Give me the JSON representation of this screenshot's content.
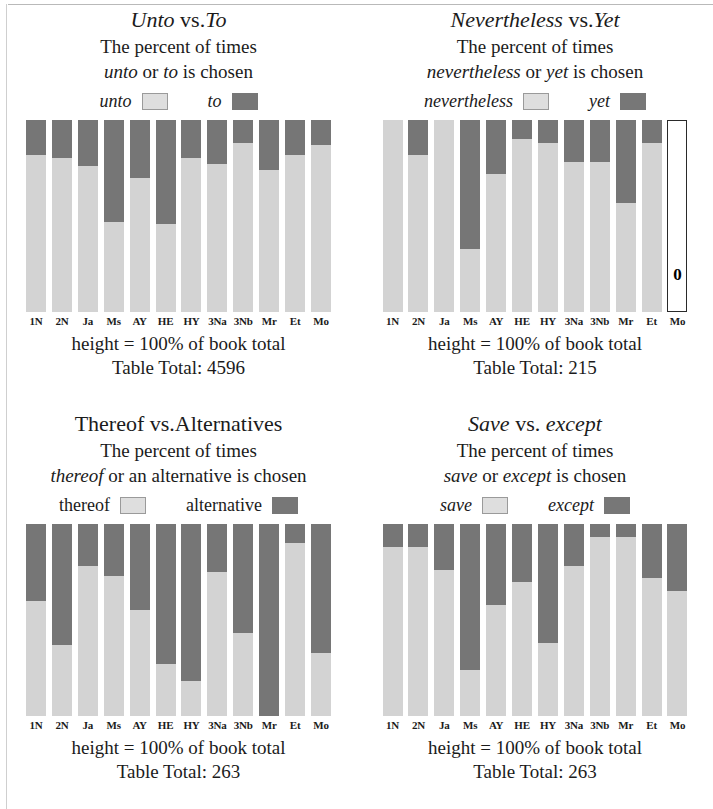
{
  "page": {
    "panel_count": 4,
    "categories": [
      "1N",
      "2N",
      "Ja",
      "Ms",
      "AY",
      "HE",
      "HY",
      "3Na",
      "3Nb",
      "Mr",
      "Et",
      "Mo"
    ]
  },
  "panels": [
    {
      "title_part1": "Unto",
      "title_vs": " vs.",
      "title_part2": "To",
      "sub_line1": "The percent of times",
      "sub_line2_a": "unto",
      "sub_line2_b": " or ",
      "sub_line2_c": "to",
      "sub_line2_d": " is chosen",
      "legend_light": "unto",
      "legend_dark": "to",
      "legend_italic": true,
      "footer_height": "height = 100% of book total",
      "footer_total": "Table Total: 4596"
    },
    {
      "title_part1": "Nevertheless",
      "title_vs": " vs.",
      "title_part2": "Yet",
      "sub_line1": "The percent of times",
      "sub_line2_a": "nevertheless",
      "sub_line2_b": " or ",
      "sub_line2_c": "yet",
      "sub_line2_d": " is chosen",
      "legend_light": "nevertheless",
      "legend_dark": "yet",
      "legend_italic": true,
      "footer_height": "height = 100% of book total",
      "footer_total": "Table Total: 215"
    },
    {
      "title_part1": "Thereof",
      "title_vs": " vs.",
      "title_part2": "Alternatives",
      "sub_line1": "The percent of times",
      "sub_line2_a": "thereof",
      "sub_line2_b": " or an alternative",
      "sub_line2_c": "",
      "sub_line2_d": " is chosen",
      "legend_light": "thereof",
      "legend_dark": "alternative",
      "legend_italic": false,
      "footer_height": "height = 100% of book total",
      "footer_total": "Table Total: 263"
    },
    {
      "title_part1": "Save",
      "title_vs": " vs. ",
      "title_part2": "except",
      "sub_line1": "The percent of times",
      "sub_line2_a": "save",
      "sub_line2_b": " or ",
      "sub_line2_c": "except",
      "sub_line2_d": " is chosen",
      "legend_light": "save",
      "legend_dark": "except",
      "legend_italic": true,
      "footer_height": "height = 100% of book total",
      "footer_total": "Table Total: 263"
    }
  ],
  "chart_data": [
    {
      "type": "bar",
      "stacked": true,
      "title": "Unto vs. To",
      "subtitle": "The percent of times unto or to is chosen",
      "xlabel": "",
      "ylabel": "percent of book total",
      "ylim": [
        0,
        100
      ],
      "grid": false,
      "legend_position": "top",
      "annotation": "height = 100% of book total",
      "table_total": 4596,
      "categories": [
        "1N",
        "2N",
        "Ja",
        "Ms",
        "AY",
        "HE",
        "HY",
        "3Na",
        "3Nb",
        "Mr",
        "Et",
        "Mo"
      ],
      "series": [
        {
          "name": "unto",
          "color": "#d3d3d3",
          "values": [
            82,
            80,
            76,
            47,
            70,
            46,
            80,
            77,
            88,
            74,
            82,
            87
          ]
        },
        {
          "name": "to",
          "color": "#767676",
          "values": [
            18,
            20,
            24,
            53,
            30,
            54,
            20,
            23,
            12,
            26,
            18,
            13
          ]
        }
      ]
    },
    {
      "type": "bar",
      "stacked": true,
      "title": "Nevertheless vs. Yet",
      "subtitle": "The percent of times nevertheless or yet is chosen",
      "xlabel": "",
      "ylabel": "percent of book total",
      "ylim": [
        0,
        100
      ],
      "grid": false,
      "legend_position": "top",
      "annotation": "height = 100% of book total",
      "table_total": 215,
      "categories": [
        "1N",
        "2N",
        "Ja",
        "Ms",
        "AY",
        "HE",
        "HY",
        "3Na",
        "3Nb",
        "Mr",
        "Et",
        "Mo"
      ],
      "empty_categories": [
        "Mo"
      ],
      "empty_label": "0",
      "series": [
        {
          "name": "nevertheless",
          "color": "#d3d3d3",
          "values": [
            100,
            82,
            100,
            33,
            72,
            90,
            88,
            78,
            78,
            57,
            88,
            0
          ]
        },
        {
          "name": "yet",
          "color": "#767676",
          "values": [
            0,
            18,
            0,
            67,
            28,
            10,
            12,
            22,
            22,
            43,
            12,
            0
          ]
        }
      ]
    },
    {
      "type": "bar",
      "stacked": true,
      "title": "Thereof vs. Alternatives",
      "subtitle": "The percent of times thereof or an alternative is chosen",
      "xlabel": "",
      "ylabel": "percent of book total",
      "ylim": [
        0,
        100
      ],
      "grid": false,
      "legend_position": "top",
      "annotation": "height = 100% of book total",
      "table_total": 263,
      "categories": [
        "1N",
        "2N",
        "Ja",
        "Ms",
        "AY",
        "HE",
        "HY",
        "3Na",
        "3Nb",
        "Mr",
        "Et",
        "Mo"
      ],
      "series": [
        {
          "name": "thereof",
          "color": "#d3d3d3",
          "values": [
            60,
            37,
            78,
            73,
            55,
            27,
            18,
            75,
            43,
            0,
            90,
            33
          ]
        },
        {
          "name": "alternative",
          "color": "#767676",
          "values": [
            40,
            63,
            22,
            27,
            45,
            73,
            82,
            25,
            57,
            100,
            10,
            67
          ]
        }
      ]
    },
    {
      "type": "bar",
      "stacked": true,
      "title": "Save vs. except",
      "subtitle": "The percent of times save or except is chosen",
      "xlabel": "",
      "ylabel": "percent of book total",
      "ylim": [
        0,
        100
      ],
      "grid": false,
      "legend_position": "top",
      "annotation": "height = 100% of book total",
      "table_total": 263,
      "categories": [
        "1N",
        "2N",
        "Ja",
        "Ms",
        "AY",
        "HE",
        "HY",
        "3Na",
        "3Nb",
        "Mr",
        "Et",
        "Mo"
      ],
      "series": [
        {
          "name": "save",
          "color": "#d3d3d3",
          "values": [
            88,
            88,
            76,
            24,
            58,
            70,
            38,
            78,
            93,
            93,
            72,
            65
          ]
        },
        {
          "name": "except",
          "color": "#767676",
          "values": [
            12,
            12,
            24,
            76,
            42,
            30,
            62,
            22,
            7,
            7,
            28,
            35
          ]
        }
      ]
    }
  ]
}
